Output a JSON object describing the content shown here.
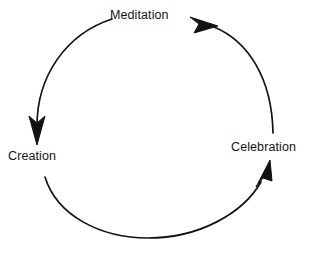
{
  "diagram": {
    "type": "cycle",
    "title": "",
    "background_color": "#ffffff",
    "stroke_color": "#121212",
    "text_color": "#141414",
    "nodes": [
      {
        "id": "meditation",
        "label": "Meditation",
        "position": "top"
      },
      {
        "id": "celebration",
        "label": "Celebration",
        "position": "right"
      },
      {
        "id": "creation",
        "label": "Creation",
        "position": "left"
      }
    ],
    "edges": [
      {
        "id": "creation-to-meditation",
        "from": "Creation",
        "to": "Meditation",
        "arrowhead": "at-meditation",
        "side": "upper-left"
      },
      {
        "id": "meditation-to-celebration",
        "from": "Meditation",
        "to": "Celebration",
        "arrowhead": "at-celebration",
        "side": "right"
      },
      {
        "id": "celebration-to-creation",
        "from": "Celebration",
        "to": "Creation",
        "arrowhead": "at-creation",
        "side": "bottom-left"
      }
    ],
    "arrows": [
      {
        "id": "arrow-into-meditation",
        "points_to": "Meditation",
        "direction": "left-up"
      },
      {
        "id": "arrow-into-creation",
        "points_to": "Creation",
        "direction": "down"
      },
      {
        "id": "arrow-into-celebration",
        "points_to": "Celebration",
        "direction": "up-right"
      }
    ]
  }
}
